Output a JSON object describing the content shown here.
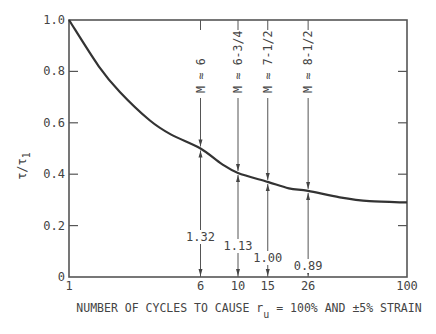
{
  "chart_data": {
    "type": "line",
    "title": "",
    "xlabel": "NUMBER OF CYCLES TO CAUSE r_u = 100% AND ±5% STRAIN",
    "xlabel_main": "NUMBER OF CYCLES TO CAUSE r",
    "xlabel_sub": "u",
    "xlabel_tail": " = 100% AND ±5% STRAIN",
    "ylabel": "τ/τ1",
    "ylabel_main": "τ/τ",
    "ylabel_sub": "1",
    "xscale": "log",
    "xlim": [
      1,
      100
    ],
    "ylim": [
      0,
      1.0
    ],
    "x_ticks": [
      1,
      6,
      10,
      15,
      26,
      100
    ],
    "x_tick_labels": [
      "1",
      "6",
      "10",
      "15",
      "26",
      "100"
    ],
    "y_ticks": [
      0,
      0.2,
      0.4,
      0.6,
      0.8,
      1.0
    ],
    "y_tick_labels": [
      "0",
      "0.2",
      "0.4",
      "0.6",
      "0.8",
      "1.0"
    ],
    "grid": false,
    "series": [
      {
        "name": "stress ratio curve",
        "x": [
          1,
          1.5,
          2,
          3,
          4,
          6,
          8,
          10,
          15,
          20,
          26,
          40,
          60,
          100
        ],
        "y": [
          1.0,
          0.82,
          0.72,
          0.61,
          0.555,
          0.5,
          0.44,
          0.405,
          0.37,
          0.345,
          0.335,
          0.31,
          0.295,
          0.29
        ]
      }
    ],
    "annotations": [
      {
        "x": 6,
        "magnitude_label": "M ≈ 6",
        "ratio_label": "1.32",
        "curve_y": 0.5
      },
      {
        "x": 10,
        "magnitude_label": "M ≈ 6-3/4",
        "ratio_label": "1.13",
        "curve_y": 0.405
      },
      {
        "x": 15,
        "magnitude_label": "M ≈ 7-1/2",
        "ratio_label": "1.00",
        "curve_y": 0.37
      },
      {
        "x": 26,
        "magnitude_label": "M ≈ 8-1/2",
        "ratio_label": "0.89",
        "curve_y": 0.335
      }
    ]
  }
}
